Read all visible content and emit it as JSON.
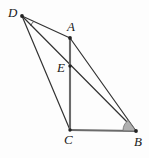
{
  "figure": {
    "kind": "geometry-diagram",
    "background_color": "#fdfdfd",
    "stroke_color": "#333333",
    "emphasis_stroke_color": "#6b6b6b",
    "angle_fill_color": "#b0b0b0",
    "label_color": "#1a1a1a",
    "points": [
      {
        "id": "D",
        "label": "D",
        "x": 22,
        "y": 16,
        "label_x": 8,
        "label_y": 6
      },
      {
        "id": "A",
        "label": "A",
        "x": 70,
        "y": 38,
        "label_x": 67,
        "label_y": 20
      },
      {
        "id": "E",
        "label": "E",
        "x": 70,
        "y": 66,
        "label_x": 57,
        "label_y": 61
      },
      {
        "id": "C",
        "label": "C",
        "x": 70,
        "y": 130,
        "label_x": 64,
        "label_y": 133
      },
      {
        "id": "B",
        "label": "B",
        "x": 136,
        "y": 131,
        "label_x": 134,
        "label_y": 135
      }
    ],
    "segments": [
      {
        "id": "DA",
        "from": "D",
        "to": "A",
        "style": "thin"
      },
      {
        "id": "DC",
        "from": "D",
        "to": "C",
        "style": "thin"
      },
      {
        "id": "DB",
        "from": "D",
        "to": "B",
        "style": "thin"
      },
      {
        "id": "AB",
        "from": "A",
        "to": "B",
        "style": "thin"
      },
      {
        "id": "CB",
        "from": "C",
        "to": "B",
        "style": "thick"
      },
      {
        "id": "AC",
        "from": "A",
        "to": "C",
        "style": "thick"
      }
    ],
    "angle_marks": [
      {
        "id": "angle-at-D",
        "vertex": "D",
        "type": "arc",
        "radius": 13
      },
      {
        "id": "angle-at-B",
        "vertex": "B",
        "type": "filled-sector",
        "radius": 13
      }
    ]
  }
}
